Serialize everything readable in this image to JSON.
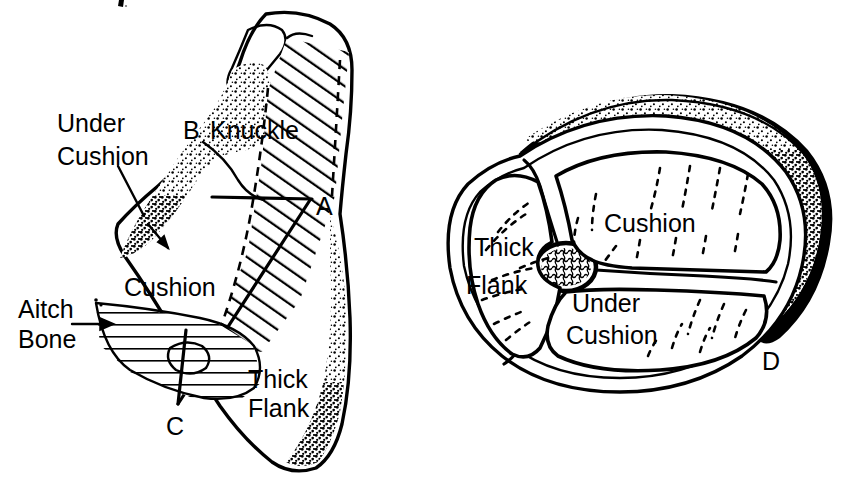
{
  "figure": {
    "kind": "anatomical-line-diagram",
    "background_color": "#ffffff",
    "ink_color": "#000000",
    "panels": [
      {
        "id": "left-panel",
        "name": "side-profile-view",
        "point_labels": [
          "A",
          "B",
          "C"
        ],
        "labels": [
          {
            "id": "under-cushion",
            "text_lines": [
              "Under",
              "Cushion"
            ],
            "has_leader": true
          },
          {
            "id": "knuckle",
            "text_lines": [
              "Knuckle"
            ],
            "has_leader": false
          },
          {
            "id": "cushion",
            "text_lines": [
              "Cushion"
            ],
            "has_leader": false
          },
          {
            "id": "aitch-bone",
            "text_lines": [
              "Aitch",
              "Bone"
            ],
            "has_leader": true
          },
          {
            "id": "thick-flank",
            "text_lines": [
              "Thick",
              "Flank"
            ],
            "has_leader": false
          }
        ]
      },
      {
        "id": "right-panel",
        "name": "cross-section-view",
        "point_labels": [
          "D"
        ],
        "labels": [
          {
            "id": "thick-flank",
            "text_lines": [
              "Thick",
              "Flank"
            ],
            "has_leader": false
          },
          {
            "id": "cushion",
            "text_lines": [
              "Cushion"
            ],
            "has_leader": false
          },
          {
            "id": "under-cushion",
            "text_lines": [
              "Under",
              "Cushion"
            ],
            "has_leader": false
          }
        ]
      }
    ]
  },
  "left": {
    "point_a": "A",
    "point_b": "B",
    "point_c": "C",
    "under_cushion_line1": "Under",
    "under_cushion_line2": "Cushion",
    "knuckle": "Knuckle",
    "cushion": "Cushion",
    "aitch_line1": "Aitch",
    "aitch_line2": "Bone",
    "thick_line1": "Thick",
    "thick_line2": "Flank"
  },
  "right": {
    "point_d": "D",
    "thick_line1": "Thick",
    "thick_line2": "Flank",
    "cushion": "Cushion",
    "under_cushion_line1": "Under",
    "under_cushion_line2": "Cushion"
  }
}
